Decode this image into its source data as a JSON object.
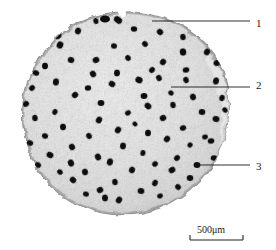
{
  "figure": {
    "kind": "optical-micrograph",
    "background_color": "#ffffff",
    "specimen": {
      "body_color": "#e9e9e9",
      "rim_color": "#b4b4b4",
      "shadow_color": "#9a9a9a",
      "pore_color": "#0d0d0d",
      "center": {
        "cx": 126,
        "cy": 113
      },
      "radius": {
        "rx": 104,
        "ry": 101
      }
    },
    "callouts": [
      {
        "id": "callout-1",
        "label": "1",
        "label_x": 256,
        "label_y": 18,
        "line_x1": 152,
        "line_y1": 21,
        "line_x2": 250,
        "line_y2": 21,
        "target": "outer-rim-edge"
      },
      {
        "id": "callout-2",
        "label": "2",
        "label_x": 256,
        "label_y": 80,
        "line_x1": 171,
        "line_y1": 87,
        "line_x2": 250,
        "line_y2": 87,
        "target": "dense-matrix"
      },
      {
        "id": "callout-3",
        "label": "3",
        "label_x": 256,
        "label_y": 161,
        "line_x1": 197,
        "line_y1": 165,
        "line_x2": 250,
        "line_y2": 165,
        "target": "channel-pore"
      }
    ],
    "scalebar": {
      "label": "500μm",
      "label_x": 197,
      "label_y": 225,
      "bar_x1": 190,
      "bar_x2": 243,
      "bar_y": 240,
      "tick_height": 5,
      "color": "#222222"
    },
    "pores": [
      [
        105,
        19,
        5.0,
        3.6
      ],
      [
        118,
        20,
        4.4,
        3.2
      ],
      [
        96,
        21,
        3.0,
        2.6
      ],
      [
        78,
        31,
        3.4,
        3.0
      ],
      [
        58,
        36,
        3.6,
        3.0
      ],
      [
        134,
        29,
        3.2,
        2.8
      ],
      [
        160,
        32,
        3.3,
        2.9
      ],
      [
        183,
        37,
        3.2,
        2.8
      ],
      [
        60,
        45,
        3.6,
        3.2
      ],
      [
        42,
        49,
        3.1,
        2.8
      ],
      [
        114,
        46,
        3.0,
        2.7
      ],
      [
        145,
        44,
        3.1,
        2.7
      ],
      [
        183,
        52,
        3.6,
        3.2
      ],
      [
        207,
        52,
        3.4,
        3.0
      ],
      [
        96,
        60,
        3.4,
        3.0
      ],
      [
        71,
        60,
        3.3,
        2.9
      ],
      [
        128,
        58,
        3.1,
        2.8
      ],
      [
        45,
        66,
        3.3,
        2.9
      ],
      [
        163,
        62,
        3.3,
        2.9
      ],
      [
        217,
        63,
        3.5,
        3.0
      ],
      [
        36,
        73,
        3.2,
        2.8
      ],
      [
        93,
        74,
        3.4,
        3.0
      ],
      [
        117,
        73,
        3.4,
        3.0
      ],
      [
        152,
        70,
        3.2,
        2.8
      ],
      [
        186,
        70,
        3.3,
        2.8
      ],
      [
        139,
        80,
        3.7,
        3.2
      ],
      [
        159,
        78,
        3.2,
        2.8
      ],
      [
        56,
        82,
        3.6,
        3.1
      ],
      [
        32,
        88,
        3.1,
        2.7
      ],
      [
        88,
        88,
        3.2,
        2.8
      ],
      [
        112,
        84,
        3.4,
        3.0
      ],
      [
        186,
        80,
        3.2,
        2.8
      ],
      [
        216,
        81,
        3.6,
        3.0
      ],
      [
        75,
        95,
        3.3,
        2.9
      ],
      [
        144,
        96,
        3.4,
        3.0
      ],
      [
        171,
        93,
        2.8,
        2.5
      ],
      [
        193,
        97,
        3.3,
        2.9
      ],
      [
        222,
        98,
        3.2,
        2.8
      ],
      [
        26,
        104,
        3.2,
        2.8
      ],
      [
        101,
        103,
        3.4,
        2.9
      ],
      [
        148,
        106,
        3.6,
        3.1
      ],
      [
        173,
        105,
        3.2,
        2.8
      ],
      [
        55,
        112,
        3.0,
        2.6
      ],
      [
        128,
        113,
        3.0,
        2.6
      ],
      [
        202,
        112,
        3.3,
        2.9
      ],
      [
        225,
        110,
        2.9,
        2.5
      ],
      [
        35,
        118,
        3.2,
        2.8
      ],
      [
        99,
        120,
        3.5,
        3.0
      ],
      [
        163,
        118,
        3.3,
        2.9
      ],
      [
        216,
        119,
        3.5,
        3.0
      ],
      [
        135,
        124,
        2.6,
        2.3
      ],
      [
        63,
        127,
        3.3,
        2.9
      ],
      [
        118,
        130,
        3.5,
        3.0
      ],
      [
        183,
        128,
        3.2,
        2.8
      ],
      [
        45,
        136,
        3.1,
        2.7
      ],
      [
        89,
        136,
        3.2,
        2.8
      ],
      [
        148,
        133,
        3.3,
        2.9
      ],
      [
        167,
        139,
        3.4,
        3.0
      ],
      [
        205,
        137,
        2.9,
        2.5
      ],
      [
        30,
        143,
        3.2,
        2.8
      ],
      [
        72,
        147,
        3.3,
        2.9
      ],
      [
        123,
        146,
        3.4,
        3.0
      ],
      [
        190,
        145,
        2.7,
        2.4
      ],
      [
        211,
        141,
        3.3,
        2.8
      ],
      [
        50,
        155,
        3.5,
        3.0
      ],
      [
        98,
        157,
        3.5,
        3.0
      ],
      [
        143,
        153,
        3.0,
        2.6
      ],
      [
        177,
        158,
        3.2,
        2.8
      ],
      [
        214,
        158,
        3.3,
        2.8
      ],
      [
        38,
        165,
        3.2,
        2.8
      ],
      [
        71,
        163,
        3.6,
        3.1
      ],
      [
        110,
        162,
        3.6,
        3.1
      ],
      [
        155,
        164,
        3.0,
        2.7
      ],
      [
        197,
        165,
        3.4,
        2.9
      ],
      [
        60,
        172,
        3.0,
        2.6
      ],
      [
        85,
        172,
        3.3,
        2.9
      ],
      [
        132,
        170,
        3.3,
        2.9
      ],
      [
        172,
        170,
        3.5,
        3.0
      ],
      [
        190,
        178,
        3.3,
        2.9
      ],
      [
        73,
        180,
        3.4,
        2.9
      ],
      [
        115,
        182,
        3.2,
        2.8
      ],
      [
        155,
        183,
        3.3,
        2.8
      ],
      [
        100,
        190,
        3.3,
        2.9
      ],
      [
        141,
        191,
        3.4,
        2.9
      ],
      [
        178,
        187,
        3.1,
        2.7
      ],
      [
        105,
        198,
        3.4,
        3.0
      ],
      [
        119,
        200,
        3.5,
        3.0
      ],
      [
        160,
        196,
        2.9,
        2.5
      ],
      [
        86,
        194,
        3.0,
        2.6
      ]
    ]
  }
}
